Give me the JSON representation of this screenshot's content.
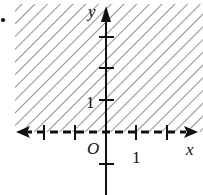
{
  "figure": {
    "type": "inequality-graph",
    "bullet": "•",
    "axes": {
      "x_label": "x",
      "y_label": "y",
      "origin_label": "O",
      "x_tick_label": "1",
      "y_tick_label": "1"
    },
    "boundary": {
      "equation": "y = 0",
      "style": "dashed"
    },
    "shaded_region": "y > 0",
    "colors": {
      "ink": "#111111",
      "hatch": "#555555",
      "background": "#ffffff"
    }
  }
}
